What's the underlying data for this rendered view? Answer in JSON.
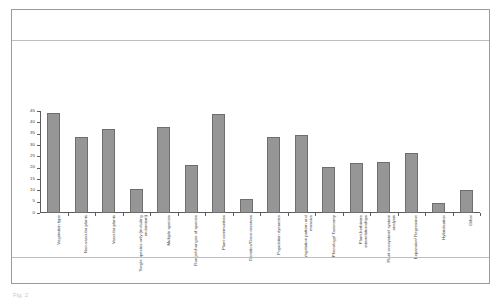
{
  "figure": {
    "title": "",
    "caption": "Fig. 2"
  },
  "chart_data": {
    "type": "bar",
    "title": "",
    "xlabel": "",
    "ylabel": "",
    "ylim": [
      0,
      45
    ],
    "ytick_step": 5,
    "grid": false,
    "legend": null,
    "bar_color": "#969696",
    "bar_border_color": "#6e6e6e",
    "axis_color": "#5d5d5d",
    "ytick_labels": [
      "0",
      "5",
      "10",
      "15",
      "20",
      "25",
      "30",
      "35",
      "40",
      "45"
    ],
    "categories": [
      "Vegetation type",
      "Non-vascular plants",
      "Vascular plants",
      "Single species only (including endemism)",
      "Multiple species",
      "Range/changes of species",
      "Plant communities",
      "Genetics/Gene reserves",
      "Population dynamics",
      "Vegetation pattern and mosaics",
      "Phenology/ Taxonomy",
      "Plant-herbivore interrelationships",
      "Plant ecosystem/ system analysis",
      "Expansion/ Regression",
      "Hybridisation",
      "Other"
    ],
    "values": [
      44,
      33.5,
      37,
      10.5,
      38,
      21,
      43.5,
      6,
      33.5,
      34.5,
      20.5,
      22,
      22.5,
      26.5,
      4.5,
      10
    ]
  }
}
